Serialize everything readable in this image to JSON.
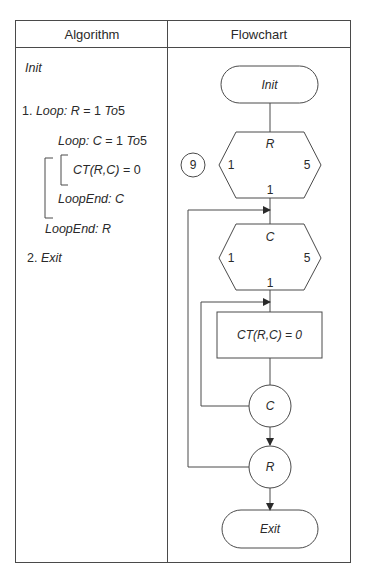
{
  "table": {
    "headers": {
      "algorithm": "Algorithm",
      "flowchart": "Flowchart"
    }
  },
  "algorithm": {
    "init": "Init",
    "step1_num": "1.",
    "step1_loop": "Loop:",
    "step1_expr": "R",
    "step1_range": "= 1",
    "step1_to": "To",
    "step1_end": "5",
    "inner_loop": "Loop:",
    "inner_expr": "C",
    "inner_range": "= 1",
    "inner_to": "To",
    "inner_end": "5",
    "body": "CT(R,C)",
    "body_value": "= 0",
    "loopend_c": "LoopEnd: C",
    "loopend_r": "LoopEnd: R",
    "step2_num": "2.",
    "step2": "Exit"
  },
  "flowchart": {
    "figure_number": "9",
    "start": "Init",
    "outer_loop": {
      "var": "R",
      "start": "1",
      "end": "5",
      "step": "1"
    },
    "inner_loop": {
      "var": "C",
      "start": "1",
      "end": "5",
      "step": "1"
    },
    "process": "CT(R,C) = 0",
    "inner_connector": "C",
    "outer_connector": "R",
    "end": "Exit"
  }
}
